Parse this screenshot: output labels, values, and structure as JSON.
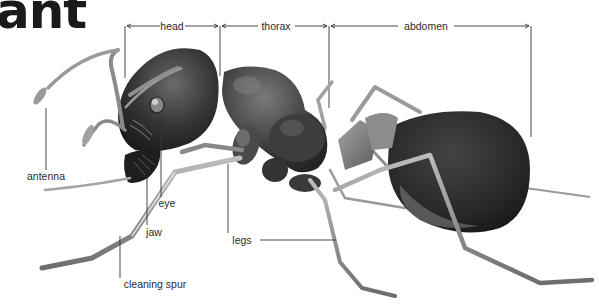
{
  "title": "ant",
  "sections": {
    "head": "head",
    "thorax": "thorax",
    "abdomen": "abdomen"
  },
  "labels": {
    "antenna": "antenna",
    "eye": "eye",
    "jaw": "jaw",
    "legs": "legs",
    "cleaning_spur": "cleaning spur"
  },
  "colors": {
    "background": "#ffffff",
    "ink": "#2b2b2b",
    "body_dark": "#2a2a2a",
    "body_mid": "#555555",
    "leg": "#8a8a8a"
  }
}
